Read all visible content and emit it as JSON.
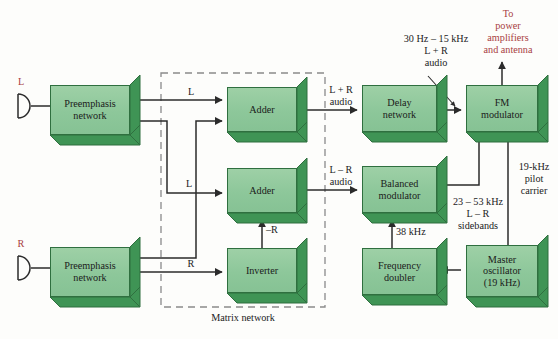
{
  "diagram": {
    "caption": "Matrix network",
    "colors": {
      "block_face": "#8dc79a",
      "block_side": "#3f9455",
      "block_border": "#2f6f3f",
      "line": "#2b2b2b",
      "accent_red": "#a8403f",
      "background": "#fdfdfb"
    }
  },
  "inputs": [
    {
      "id": "left",
      "label": "L",
      "mic": "microphone-icon"
    },
    {
      "id": "right",
      "label": "R",
      "mic": "microphone-icon"
    }
  ],
  "blocks": [
    {
      "id": "preemph-left",
      "label": "Preemphasis\nnetwork"
    },
    {
      "id": "preemph-right",
      "label": "Preemphasis\nnetwork"
    },
    {
      "id": "adder-top",
      "label": "Adder"
    },
    {
      "id": "adder-mid",
      "label": "Adder"
    },
    {
      "id": "inverter",
      "label": "Inverter"
    },
    {
      "id": "delay-network",
      "label": "Delay\nnetwork"
    },
    {
      "id": "balanced-mod",
      "label": "Balanced\nmodulator"
    },
    {
      "id": "freq-doubler",
      "label": "Frequency\ndoubler"
    },
    {
      "id": "master-osc",
      "label": "Master\noscillator\n(19 kHz)"
    },
    {
      "id": "fm-modulator",
      "label": "FM\nmodulator"
    }
  ],
  "signal_labels": {
    "l_to_adder_top": "L",
    "l_to_adder_mid": "L",
    "r_to_inverter": "R",
    "minus_r": "–R",
    "sum_audio": "L + R\naudio",
    "diff_audio": "L – R\naudio",
    "baseband_audio": "30 Hz – 15 kHz\nL + R\naudio",
    "sidebands": "23 – 53 kHz\nL – R\nsidebands",
    "pilot": "19-kHz\npilot\ncarrier",
    "subcarrier": "38 kHz",
    "output": "To\npower\namplifiers\nand antenna"
  }
}
